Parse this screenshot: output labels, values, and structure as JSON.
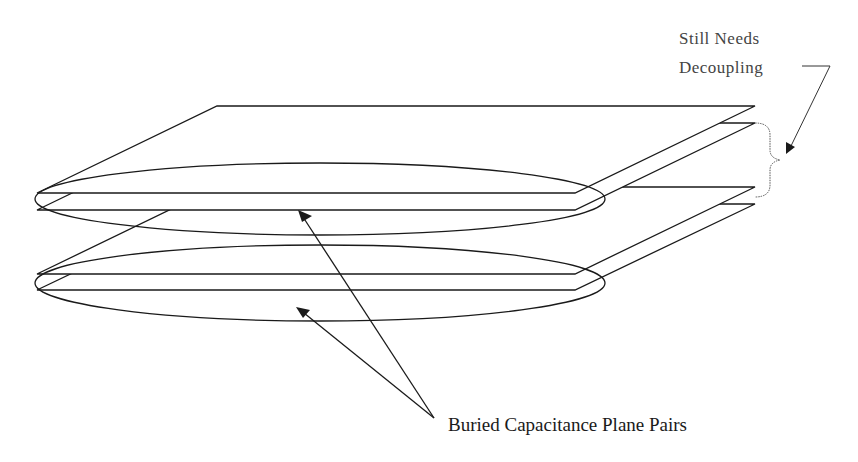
{
  "diagram": {
    "planes": [
      {
        "name": "plane-1",
        "pair": 1
      },
      {
        "name": "plane-2",
        "pair": 1
      },
      {
        "name": "plane-3",
        "pair": 2
      },
      {
        "name": "plane-4",
        "pair": 2
      }
    ],
    "labels": {
      "still_needs_line1": "Still Needs",
      "still_needs_line2": "Decoupling",
      "buried_pairs": "Buried Capacitance Plane Pairs"
    },
    "colors": {
      "line": "#1a1a1a",
      "background": "#ffffff"
    }
  }
}
